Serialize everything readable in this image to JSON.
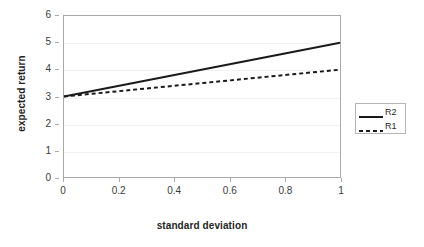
{
  "chart_data": {
    "type": "line",
    "title": "",
    "xlabel": "standard deviation",
    "ylabel": "expected return",
    "xlim": [
      0,
      1
    ],
    "ylim": [
      0,
      6
    ],
    "x_ticks": [
      "0",
      "0.2",
      "0.4",
      "0.6",
      "0.8",
      "1"
    ],
    "x_tick_values": [
      0,
      0.2,
      0.4,
      0.6,
      0.8,
      1
    ],
    "y_ticks": [
      "0",
      "1",
      "2",
      "3",
      "4",
      "5",
      "6"
    ],
    "y_tick_values": [
      0,
      1,
      2,
      3,
      4,
      5,
      6
    ],
    "grid": true,
    "legend_position": "right",
    "series": [
      {
        "name": "R2",
        "style": "solid",
        "color": "#1a1a1a",
        "x": [
          0,
          1
        ],
        "values": [
          3,
          5
        ]
      },
      {
        "name": "R1",
        "style": "dashed",
        "color": "#1a1a1a",
        "x": [
          0,
          1
        ],
        "values": [
          3,
          4
        ]
      }
    ]
  },
  "axes": {
    "x_title": "standard deviation",
    "y_title": "expected return",
    "x_tick_labels": [
      "0",
      "0.2",
      "0.4",
      "0.6",
      "0.8",
      "1"
    ],
    "y_tick_labels": [
      "0",
      "1",
      "2",
      "3",
      "4",
      "5",
      "6"
    ]
  },
  "legend": {
    "entries": [
      {
        "label": "R2",
        "style": "solid"
      },
      {
        "label": "R1",
        "style": "dashed"
      }
    ]
  },
  "colors": {
    "series_line": "#1a1a1a",
    "axis": "#a9a9a9",
    "gridline": "#f2f2f2",
    "text": "#333333",
    "plot_background": "#ffffff",
    "legend_border": "#b5b5b5"
  }
}
